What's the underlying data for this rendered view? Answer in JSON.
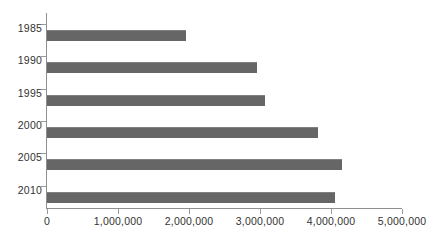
{
  "chart_data": {
    "type": "bar",
    "orientation": "horizontal",
    "title": "",
    "subtitle": "",
    "xlabel": "",
    "ylabel": "",
    "categories": [
      "1985",
      "1990",
      "1995",
      "2000",
      "2005",
      "2010"
    ],
    "values": [
      1960000,
      2960000,
      3070000,
      3820000,
      4150000,
      4060000
    ],
    "series": [
      {
        "name": "",
        "values": [
          1960000,
          2960000,
          3070000,
          3820000,
          4150000,
          4060000
        ]
      }
    ],
    "xlim": [
      0,
      5000000
    ],
    "xticks": [
      0,
      1000000,
      2000000,
      3000000,
      4000000,
      5000000
    ],
    "xtick_labels": [
      "0",
      "1,000,000",
      "2,000,000",
      "3,000,000",
      "4,000,000",
      "5,000,000"
    ],
    "ytick_labels": [
      "1985",
      "1990",
      "1995",
      "2000",
      "2005",
      "2010"
    ],
    "grid": false,
    "legend": false,
    "legend_position": "none",
    "annotations": [],
    "colors": {
      "bar": "#666666",
      "bar_highlight": "#808080",
      "axis": "#8f8f8f",
      "tick": "#9a9a9a",
      "text": "#333333",
      "background": "#ffffff"
    }
  }
}
